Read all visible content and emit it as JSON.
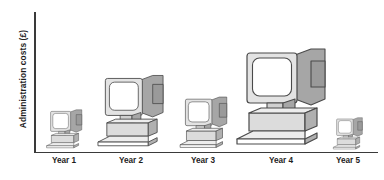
{
  "chart_data": {
    "type": "bar",
    "title": "",
    "subtitle": "",
    "xlabel": "",
    "ylabel": "Administration costs (£)",
    "categories": [
      "Year 1",
      "Year 2",
      "Year 3",
      "Year 4",
      "Year 5"
    ],
    "values": [
      32,
      62,
      42,
      88,
      25
    ],
    "ylim": [
      0,
      100
    ],
    "grid": false,
    "legend": null,
    "annotations": [],
    "note": "Pictogram chart: each category is drawn as a 3D desktop-computer icon whose overall size encodes the value. Year 4 largest, Year 5 smallest.",
    "marker": "desktop-computer-icon"
  },
  "axes": {
    "y_label": "Administration costs (£)",
    "y_axis_name": "y-axis-line",
    "x_axis_name": "x-axis-line",
    "tick_labels": [
      "Year 1",
      "Year 2",
      "Year 3",
      "Year 4",
      "Year 5"
    ]
  },
  "icons": [
    {
      "name": "computer-icon-year-1",
      "label": "Year 1",
      "value": 32,
      "center_x": 64,
      "scale": 0.4
    },
    {
      "name": "computer-icon-year-2",
      "label": "Year 2",
      "value": 62,
      "center_x": 131,
      "scale": 0.74
    },
    {
      "name": "computer-icon-year-3",
      "label": "Year 3",
      "value": 42,
      "center_x": 203,
      "scale": 0.53
    },
    {
      "name": "computer-icon-year-4",
      "label": "Year 4",
      "value": 88,
      "center_x": 281,
      "scale": 1.0
    },
    {
      "name": "computer-icon-year-5",
      "label": "Year 5",
      "value": 25,
      "center_x": 348,
      "scale": 0.33
    }
  ],
  "colors": {
    "background": "#ffffff",
    "axis": "#3a3a3a",
    "text": "#1d1d1d",
    "screen": "#ffffff",
    "bezel": "#e3e3e3",
    "bezel_shade": "#d0d0d0",
    "side_panel": "#a6a6a6",
    "side_panel_dark": "#9a9a9a",
    "base_top": "#ededed",
    "base_front": "#dcdcdc",
    "base_side": "#b0b0b0",
    "outline": "#4a4a4a"
  }
}
